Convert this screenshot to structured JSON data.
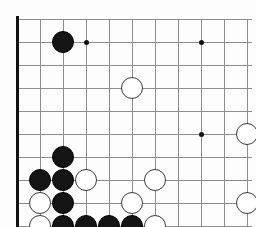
{
  "diagram": {
    "type": "go-board-diagram",
    "board": {
      "edges": {
        "left": "thick",
        "bottom": "thick",
        "top": "open",
        "right": "open"
      },
      "line_color": "#8c8c8c",
      "edge_color": "#111111",
      "background": "#fdfdfd",
      "origin_x": 17,
      "origin_y": 19,
      "spacing_x": 23,
      "spacing_y": 23,
      "cols": 11,
      "rows": 9,
      "stone_radius": 11
    },
    "hoshi_points": [
      {
        "name": "star-point-upper-left",
        "col": 3,
        "row": 1
      },
      {
        "name": "star-point-upper-right",
        "col": 8,
        "row": 1
      },
      {
        "name": "star-point-center-right",
        "col": 8,
        "row": 5
      }
    ],
    "colors": {
      "black_stone": "#141414",
      "white_stone": "#ffffff",
      "stone_outline": "#3a3a3a",
      "black_label": "#ffffff",
      "white_label": "#111111"
    },
    "stones": [
      {
        "id": "black-d17",
        "color": "black",
        "col": 2,
        "row": 1,
        "label": ""
      },
      {
        "id": "white-f15",
        "color": "white",
        "col": 5,
        "row": 3,
        "label": ""
      },
      {
        "id": "white-k13",
        "color": "white",
        "col": 10,
        "row": 5,
        "label": ""
      },
      {
        "id": "black-c12",
        "color": "black",
        "col": 2,
        "row": 6,
        "label": ""
      },
      {
        "id": "black-b11",
        "color": "black",
        "col": 1,
        "row": 7,
        "label": ""
      },
      {
        "id": "black-c11",
        "color": "black",
        "col": 2,
        "row": 7,
        "label": ""
      },
      {
        "id": "white-d11",
        "color": "white",
        "col": 3,
        "row": 7,
        "label": ""
      },
      {
        "id": "white-f11",
        "color": "white",
        "col": 6,
        "row": 7,
        "label": ""
      },
      {
        "id": "white-b10",
        "color": "white",
        "col": 1,
        "row": 8,
        "label": ""
      },
      {
        "id": "black-c10",
        "color": "black",
        "col": 2,
        "row": 8,
        "label": ""
      },
      {
        "id": "white-e10",
        "color": "white",
        "col": 5,
        "row": 8,
        "label": ""
      },
      {
        "id": "white-k10",
        "color": "white",
        "col": 10,
        "row": 8,
        "label": ""
      },
      {
        "id": "white-b9",
        "color": "white",
        "col": 1,
        "row": 9,
        "label": ""
      },
      {
        "id": "black-c9",
        "color": "black",
        "col": 2,
        "row": 9,
        "label": ""
      },
      {
        "id": "black-d9",
        "color": "black",
        "col": 3,
        "row": 9,
        "label": ""
      },
      {
        "id": "black-e9",
        "color": "black",
        "col": 4,
        "row": 9,
        "label": ""
      },
      {
        "id": "black-f9",
        "color": "black",
        "col": 5,
        "row": 9,
        "label": ""
      },
      {
        "id": "white-g9",
        "color": "white",
        "col": 6,
        "row": 9,
        "label": ""
      },
      {
        "id": "white-b8",
        "color": "white",
        "col": 1,
        "row": 10,
        "label": ""
      },
      {
        "id": "white-c8",
        "color": "white",
        "col": 2,
        "row": 10,
        "label": ""
      },
      {
        "id": "white-d8",
        "color": "white",
        "col": 3,
        "row": 10,
        "label": ""
      },
      {
        "id": "black-e8",
        "color": "black",
        "col": 4,
        "row": 10,
        "label": ""
      },
      {
        "id": "white-f8",
        "color": "white",
        "col": 5,
        "row": 10,
        "label": ""
      },
      {
        "id": "white-g8",
        "color": "white",
        "col": 6,
        "row": 10,
        "label": ""
      },
      {
        "id": "white-d7",
        "color": "white",
        "col": 3,
        "row": 11,
        "label": ""
      },
      {
        "id": "black-e7",
        "color": "black",
        "col": 4,
        "row": 11,
        "label": ""
      },
      {
        "id": "move-5",
        "color": "black",
        "col": 7,
        "row": 11,
        "label": "5"
      },
      {
        "id": "move-4",
        "color": "white",
        "col": 1,
        "row": 12,
        "label": "4"
      },
      {
        "id": "move-2",
        "color": "white",
        "col": 2,
        "row": 12,
        "label": "2"
      },
      {
        "id": "move-1",
        "color": "black",
        "col": 3,
        "row": 12,
        "label": "1"
      },
      {
        "id": "move-3",
        "color": "black",
        "col": 4,
        "row": 12,
        "label": "3"
      }
    ],
    "move_sequence": [
      {
        "number": "1",
        "color": "black"
      },
      {
        "number": "2",
        "color": "white"
      },
      {
        "number": "3",
        "color": "black"
      },
      {
        "number": "4",
        "color": "white"
      },
      {
        "number": "5",
        "color": "black"
      }
    ]
  }
}
